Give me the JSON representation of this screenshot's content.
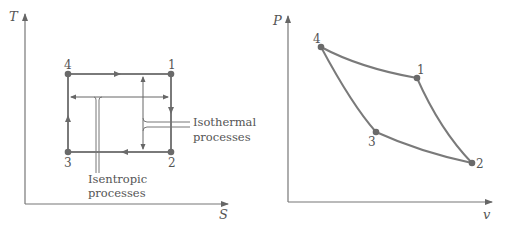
{
  "colors": {
    "background": "#ffffff",
    "line": "#7a7a7a",
    "point": "#6a6a6a",
    "text": "#555555",
    "leader": "#8a8a8a"
  },
  "ts_diagram": {
    "y_axis_label": "T",
    "x_axis_label": "S",
    "points": [
      {
        "label": "1",
        "x": 171,
        "y": 74
      },
      {
        "label": "2",
        "x": 171,
        "y": 152
      },
      {
        "label": "3",
        "x": 68,
        "y": 152
      },
      {
        "label": "4",
        "x": 68,
        "y": 74
      }
    ],
    "annotations": {
      "isothermal_line1": "Isothermal",
      "isothermal_line2": "processes",
      "isentropic_line1": "Isentropic",
      "isentropic_line2": "processes"
    }
  },
  "pv_diagram": {
    "y_axis_label": "P",
    "x_axis_label": "v",
    "points": [
      {
        "label": "1",
        "x": 417,
        "y": 78
      },
      {
        "label": "2",
        "x": 472,
        "y": 163
      },
      {
        "label": "3",
        "x": 376,
        "y": 132
      },
      {
        "label": "4",
        "x": 321,
        "y": 47
      }
    ]
  }
}
